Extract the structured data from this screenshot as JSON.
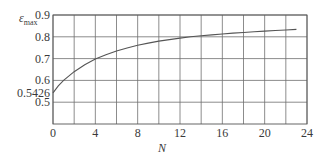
{
  "chart_data": {
    "type": "line",
    "title": "",
    "xlabel": "N",
    "ylabel": "ε",
    "ylabel_subscript": "max",
    "xlim": [
      0,
      24
    ],
    "ylim": [
      0.4,
      0.9
    ],
    "x_ticks": [
      "0",
      "4",
      "8",
      "12",
      "16",
      "20",
      "24"
    ],
    "y_ticks": [
      "0.5",
      "0.6",
      "0.7",
      "0.8",
      "0.9"
    ],
    "annotated_y_tick": "0.5426",
    "grid": true,
    "grid_x_step": 2,
    "grid_y_step": 0.1,
    "legend": "none",
    "series": [
      {
        "name": "ε_max",
        "x": [
          0,
          0.5,
          1,
          2,
          3,
          4,
          5,
          6,
          7,
          8,
          9,
          10,
          11,
          12,
          13,
          14,
          15,
          16,
          17,
          18,
          19,
          20,
          21,
          22,
          23
        ],
        "values": [
          0.5426,
          0.575,
          0.6,
          0.64,
          0.672,
          0.698,
          0.718,
          0.735,
          0.749,
          0.761,
          0.771,
          0.78,
          0.787,
          0.794,
          0.8,
          0.805,
          0.809,
          0.813,
          0.817,
          0.82,
          0.823,
          0.826,
          0.829,
          0.831,
          0.834
        ]
      }
    ]
  },
  "colors": {
    "line": "#555555",
    "grid": "#6e6e6e",
    "axis": "#555555",
    "text": "#3a3a3a"
  }
}
